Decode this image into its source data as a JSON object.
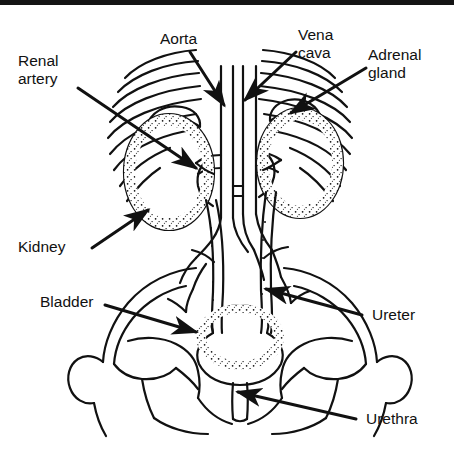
{
  "figure": {
    "background_color": "#ffffff",
    "ink_color": "#111111",
    "top_band_color": "#141414",
    "width": 454,
    "height": 459
  },
  "labels": {
    "renal_artery_line1": "Renal",
    "renal_artery_line2": "artery",
    "aorta": "Aorta",
    "vena_cava_line1": "Vena",
    "vena_cava_line2": "cava",
    "adrenal_gland_line1": "Adrenal",
    "adrenal_gland_line2": "gland",
    "kidney": "Kidney",
    "bladder": "Bladder",
    "ureter": "Ureter",
    "urethra": "Urethra"
  },
  "callouts": [
    {
      "name": "renal-artery",
      "text": "Renal artery",
      "text_x": 18,
      "text_y": 66,
      "arrow_from": [
        78,
        88
      ],
      "arrow_to": [
        196,
        168
      ],
      "lines": 2
    },
    {
      "name": "aorta",
      "text": "Aorta",
      "text_x": 160,
      "text_y": 44,
      "arrow_from": [
        190,
        52
      ],
      "arrow_to": [
        224,
        105
      ],
      "lines": 1
    },
    {
      "name": "vena-cava",
      "text": "Vena cava",
      "text_x": 298,
      "text_y": 40,
      "arrow_from": [
        296,
        52
      ],
      "arrow_to": [
        245,
        100
      ],
      "lines": 2
    },
    {
      "name": "adrenal-gland",
      "text": "Adrenal gland",
      "text_x": 368,
      "text_y": 60,
      "arrow_from": [
        366,
        68
      ],
      "arrow_to": [
        291,
        113
      ],
      "lines": 2
    },
    {
      "name": "kidney",
      "text": "Kidney",
      "text_x": 18,
      "text_y": 252,
      "arrow_from": [
        92,
        248
      ],
      "arrow_to": [
        148,
        210
      ],
      "lines": 1
    },
    {
      "name": "bladder",
      "text": "Bladder",
      "text_x": 40,
      "text_y": 307,
      "arrow_from": [
        105,
        305
      ],
      "arrow_to": [
        196,
        332
      ],
      "lines": 1
    },
    {
      "name": "ureter",
      "text": "Ureter",
      "text_x": 366,
      "text_y": 320,
      "arrow_from": [
        362,
        315
      ],
      "arrow_to": [
        266,
        289
      ],
      "lines": 1
    },
    {
      "name": "urethra",
      "text": "Urethra",
      "text_x": 360,
      "text_y": 424,
      "arrow_from": [
        356,
        419
      ],
      "arrow_to": [
        238,
        392
      ],
      "lines": 1
    }
  ],
  "anatomy": {
    "parts": [
      "ribs-left",
      "ribs-right",
      "aorta-vessel",
      "vena-cava-vessel",
      "kidney-left",
      "kidney-right",
      "adrenal-gland-left",
      "adrenal-gland-right",
      "renal-artery-left",
      "renal-artery-right",
      "ureter-left",
      "ureter-right",
      "bladder",
      "urethra",
      "pelvis-left",
      "pelvis-right",
      "sacrum"
    ]
  }
}
